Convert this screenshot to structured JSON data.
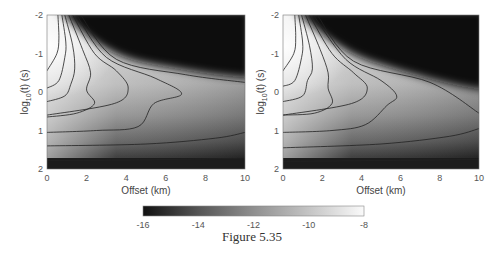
{
  "caption": "Figure 5.35",
  "chart_data": [
    {
      "type": "heatmap",
      "panel": "left",
      "title": "",
      "xlabel": "Offset (km)",
      "ylabel": "log10(t) (s)",
      "xlim": [
        0,
        10
      ],
      "ylim": [
        -2,
        2
      ],
      "y_reversed": true,
      "xticks": [
        0,
        2,
        4,
        6,
        8,
        10
      ],
      "yticks": [
        -2,
        -1,
        0,
        1,
        2
      ],
      "colormap": "gray",
      "color_range": [
        -16,
        -8
      ],
      "contours": [
        {
          "level": "c1",
          "points": [
            [
              0.55,
              -2
            ],
            [
              0.6,
              -1.4
            ],
            [
              0.5,
              -1.0
            ],
            [
              0.0,
              -0.55
            ]
          ]
        },
        {
          "level": "c2",
          "points": [
            [
              0.75,
              -2
            ],
            [
              0.95,
              -1.3
            ],
            [
              0.9,
              -0.9
            ],
            [
              0.6,
              -0.3
            ],
            [
              0.0,
              -0.1
            ]
          ]
        },
        {
          "level": "c3",
          "points": [
            [
              0.9,
              -2
            ],
            [
              1.3,
              -1.2
            ],
            [
              1.4,
              -0.6
            ],
            [
              1.2,
              -0.2
            ],
            [
              0.9,
              0.1
            ],
            [
              0.0,
              0.25
            ]
          ]
        },
        {
          "level": "c4",
          "points": [
            [
              1.1,
              -2
            ],
            [
              1.8,
              -1.1
            ],
            [
              2.2,
              -0.5
            ],
            [
              2.0,
              -0.05
            ],
            [
              2.4,
              0.3
            ],
            [
              1.5,
              0.55
            ],
            [
              0.0,
              0.65
            ]
          ]
        },
        {
          "level": "c5",
          "points": [
            [
              1.3,
              -2
            ],
            [
              2.4,
              -1.0
            ],
            [
              3.5,
              -0.55
            ],
            [
              4.1,
              -0.1
            ],
            [
              3.4,
              0.3
            ],
            [
              0.0,
              0.6
            ]
          ]
        },
        {
          "level": "c6",
          "points": [
            [
              1.5,
              -2
            ],
            [
              3.0,
              -0.9
            ],
            [
              5.5,
              -0.35
            ],
            [
              6.8,
              0.05
            ],
            [
              5.4,
              0.3
            ],
            [
              4.6,
              0.9
            ],
            [
              2.5,
              1.0
            ],
            [
              0.0,
              1.05
            ]
          ]
        },
        {
          "level": "c7",
          "points": [
            [
              1.7,
              -2
            ],
            [
              3.5,
              -0.85
            ],
            [
              7.0,
              -0.45
            ],
            [
              10.0,
              -0.25
            ]
          ]
        },
        {
          "level": "c8",
          "points": [
            [
              0.0,
              1.4
            ],
            [
              5.0,
              1.35
            ],
            [
              8.5,
              1.2
            ],
            [
              10.0,
              1.05
            ]
          ]
        },
        {
          "level": "c9",
          "points": [
            [
              0.0,
              1.78
            ],
            [
              5.0,
              1.76
            ],
            [
              10.0,
              1.72
            ]
          ]
        }
      ]
    },
    {
      "type": "heatmap",
      "panel": "right",
      "title": "",
      "xlabel": "Offset (km)",
      "ylabel": "log10(t) (s)",
      "xlim": [
        0,
        10
      ],
      "ylim": [
        -2,
        2
      ],
      "y_reversed": true,
      "xticks": [
        0,
        2,
        4,
        6,
        8,
        10
      ],
      "yticks": [
        -2,
        -1,
        0,
        1,
        2
      ],
      "colormap": "gray",
      "color_range": [
        -16,
        -8
      ],
      "contours": [
        {
          "level": "c1",
          "points": [
            [
              0.6,
              -2
            ],
            [
              0.65,
              -1.4
            ],
            [
              0.55,
              -1.0
            ],
            [
              0.0,
              -0.55
            ]
          ]
        },
        {
          "level": "c2",
          "points": [
            [
              0.8,
              -2
            ],
            [
              1.0,
              -1.3
            ],
            [
              0.95,
              -0.9
            ],
            [
              0.6,
              -0.3
            ],
            [
              0.0,
              -0.15
            ]
          ]
        },
        {
          "level": "c3",
          "points": [
            [
              0.95,
              -2
            ],
            [
              1.35,
              -1.2
            ],
            [
              1.5,
              -0.6
            ],
            [
              1.25,
              -0.3
            ],
            [
              1.0,
              0.1
            ],
            [
              0.0,
              0.25
            ]
          ]
        },
        {
          "level": "c4",
          "points": [
            [
              1.15,
              -2
            ],
            [
              1.9,
              -1.1
            ],
            [
              2.3,
              -0.5
            ],
            [
              2.3,
              -0.1
            ],
            [
              2.5,
              0.3
            ],
            [
              1.6,
              0.55
            ],
            [
              0.0,
              0.6
            ]
          ]
        },
        {
          "level": "c5",
          "points": [
            [
              1.35,
              -2
            ],
            [
              2.5,
              -1.0
            ],
            [
              3.6,
              -0.5
            ],
            [
              4.3,
              -0.1
            ],
            [
              3.5,
              0.3
            ],
            [
              0.0,
              0.6
            ]
          ]
        },
        {
          "level": "c6",
          "points": [
            [
              1.55,
              -2
            ],
            [
              3.2,
              -0.85
            ],
            [
              5.0,
              -0.3
            ],
            [
              5.8,
              0.1
            ],
            [
              5.3,
              0.35
            ],
            [
              4.2,
              0.85
            ],
            [
              2.5,
              1.0
            ],
            [
              0.0,
              1.05
            ]
          ]
        },
        {
          "level": "c7",
          "points": [
            [
              1.75,
              -2
            ],
            [
              3.6,
              -0.8
            ],
            [
              7.5,
              -0.25
            ],
            [
              10.0,
              0.55
            ]
          ]
        },
        {
          "level": "c8",
          "points": [
            [
              0.0,
              1.45
            ],
            [
              5.0,
              1.35
            ],
            [
              8.5,
              1.15
            ],
            [
              10.0,
              0.95
            ]
          ]
        },
        {
          "level": "c9",
          "points": [
            [
              0.0,
              1.8
            ],
            [
              5.0,
              1.78
            ],
            [
              10.0,
              1.75
            ]
          ]
        }
      ]
    },
    {
      "type": "colorbar",
      "orientation": "horizontal",
      "range": [
        -16,
        -8
      ],
      "ticks": [
        -16,
        -14,
        -12,
        -10,
        -8
      ],
      "colormap": "gray"
    }
  ],
  "panels": {
    "left": {
      "xlabel": "Offset (km)",
      "ylabel_main": "log",
      "ylabel_sub": "10",
      "ylabel_rest": "(t) (s)",
      "xticks": [
        "0",
        "2",
        "4",
        "6",
        "8",
        "10"
      ],
      "yticks": [
        "-2",
        "-1",
        "0",
        "1",
        "2"
      ]
    },
    "right": {
      "xlabel": "Offset (km)",
      "ylabel_main": "log",
      "ylabel_sub": "10",
      "ylabel_rest": "(t) (s)",
      "xticks": [
        "0",
        "2",
        "4",
        "6",
        "8",
        "10"
      ],
      "yticks": [
        "-2",
        "-1",
        "0",
        "1",
        "2"
      ]
    }
  },
  "colorbar": {
    "ticks": [
      "-16",
      "-14",
      "-12",
      "-10",
      "-8"
    ]
  }
}
